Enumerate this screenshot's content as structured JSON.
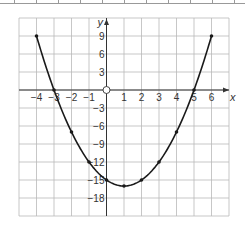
{
  "chart_data": {
    "type": "line",
    "title": "",
    "xlabel": "x",
    "ylabel": "y",
    "xlim": [
      -5,
      7
    ],
    "ylim": [
      -21,
      12
    ],
    "grid": true,
    "x_ticks": [
      -4,
      -3,
      -2,
      -1,
      1,
      2,
      3,
      4,
      5,
      6
    ],
    "x_tick_labels": [
      "−4",
      "−3",
      "−2",
      "−1",
      "1",
      "2",
      "3",
      "4",
      "5",
      "6"
    ],
    "y_ticks": [
      9,
      6,
      3,
      -3,
      -6,
      -9,
      -12,
      -15,
      -18
    ],
    "y_tick_labels": [
      "9",
      "6",
      "3",
      "−3",
      "−6",
      "−9",
      "−12",
      "−15",
      "−18"
    ],
    "origin_label": "O",
    "series": [
      {
        "name": "y = x² − 2x − 15",
        "x": [
          -4,
          -3,
          -2,
          -1,
          0,
          1,
          2,
          3,
          4,
          5,
          6
        ],
        "y": [
          9,
          0,
          -7,
          -12,
          -15,
          -16,
          -15,
          -12,
          -7,
          0,
          9
        ],
        "color": "#1a1a1a",
        "markers": true
      }
    ]
  },
  "table_fragment": {
    "dividers_x": [
      14,
      36,
      58,
      80,
      102,
      124,
      146,
      168,
      190,
      212,
      234
    ]
  },
  "colors": {
    "grid": "#b9b9b9",
    "axis": "#333333",
    "curve": "#1a1a1a",
    "text": "#333333"
  }
}
